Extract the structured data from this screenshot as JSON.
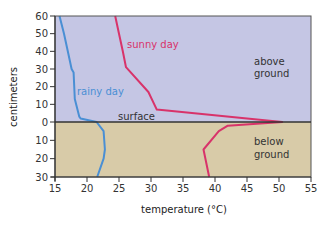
{
  "chart_data": {
    "type": "line",
    "title": "",
    "xlabel": "temperature  (°C)",
    "ylabel": "centimeters",
    "xlim": [
      15,
      55
    ],
    "x_ticks": [
      15,
      20,
      25,
      30,
      35,
      40,
      45,
      50,
      55
    ],
    "y_ticks_above": [
      60,
      50,
      40,
      30,
      20,
      10,
      0
    ],
    "y_ticks_below": [
      10,
      20,
      30
    ],
    "y_range": {
      "above_ground_max": 60,
      "below_ground_max": 30
    },
    "grid": false,
    "regions": [
      {
        "name": "above ground",
        "label_lines": [
          "above",
          "ground"
        ],
        "color": "#c5c6e4"
      },
      {
        "name": "below ground",
        "label_lines": [
          "below",
          "ground"
        ],
        "color": "#d8cba8"
      }
    ],
    "surface_label": "surface",
    "series": [
      {
        "name": "rainy day",
        "color": "#4a8fd4",
        "points": [
          {
            "height_cm": 60,
            "temp": 15.7
          },
          {
            "height_cm": 50,
            "temp": 16.4
          },
          {
            "height_cm": 40,
            "temp": 17.0
          },
          {
            "height_cm": 30,
            "temp": 17.6
          },
          {
            "height_cm": 28,
            "temp": 17.9
          },
          {
            "height_cm": 13,
            "temp": 18.1
          },
          {
            "height_cm": 3,
            "temp": 18.8
          },
          {
            "height_cm": 2,
            "temp": 19.0
          },
          {
            "height_cm": 0,
            "temp": 21.5
          },
          {
            "height_cm": -5,
            "temp": 22.6
          },
          {
            "height_cm": -15,
            "temp": 22.8
          },
          {
            "height_cm": -20,
            "temp": 22.6
          },
          {
            "height_cm": -30,
            "temp": 21.6
          }
        ]
      },
      {
        "name": "sunny day",
        "color": "#d8336a",
        "points": [
          {
            "height_cm": 60,
            "temp": 24.4
          },
          {
            "height_cm": 50,
            "temp": 25.0
          },
          {
            "height_cm": 40,
            "temp": 25.6
          },
          {
            "height_cm": 31,
            "temp": 26.1
          },
          {
            "height_cm": 17,
            "temp": 29.6
          },
          {
            "height_cm": 7,
            "temp": 30.9
          },
          {
            "height_cm": 0,
            "temp": 50.5
          },
          {
            "height_cm": -2,
            "temp": 42.0
          },
          {
            "height_cm": -5,
            "temp": 40.6
          },
          {
            "height_cm": -15,
            "temp": 38.2
          },
          {
            "height_cm": -30,
            "temp": 39.1
          }
        ]
      }
    ],
    "legend": "inline labels"
  },
  "labels": {
    "ylabel": "centimeters",
    "xlabel": "temperature  (°C)",
    "surface": "surface",
    "above_1": "above",
    "above_2": "ground",
    "below_1": "below",
    "below_2": "ground",
    "rainy": "rainy day",
    "sunny": "sunny day"
  }
}
